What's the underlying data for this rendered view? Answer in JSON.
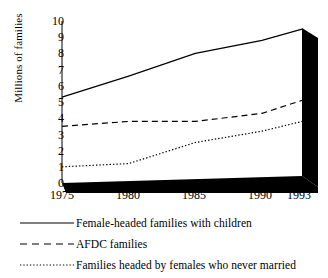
{
  "chart_data": {
    "type": "line",
    "title": "",
    "xlabel": "",
    "ylabel": "Millions of families",
    "x": [
      1975,
      1980,
      1985,
      1990,
      1993
    ],
    "xlim": [
      1975,
      1993
    ],
    "ylim": [
      0,
      10
    ],
    "ytick_labels": [
      "10",
      "9",
      "8",
      "7",
      "6",
      "5",
      "4",
      "3",
      "2",
      "1",
      "0"
    ],
    "ytick_values": [
      10,
      9,
      8,
      7,
      6,
      5,
      4,
      3,
      2,
      1,
      0
    ],
    "xtick_labels": [
      "1975",
      "1980",
      "1985",
      "1990",
      "1993"
    ],
    "grid": false,
    "legend_position": "below",
    "series": [
      {
        "name": "Female-headed families with children",
        "style": "solid",
        "values": [
          5.3,
          6.6,
          8.0,
          8.8,
          9.5
        ]
      },
      {
        "name": "AFDC families",
        "style": "dashed",
        "values": [
          3.5,
          3.8,
          3.8,
          4.3,
          5.1
        ]
      },
      {
        "name": "Families headed by females who never married",
        "style": "dotted",
        "values": [
          1.0,
          1.2,
          2.5,
          3.2,
          3.8
        ]
      }
    ]
  },
  "axis": {
    "y_title": "Millions of families",
    "y_ticks": [
      "10",
      "9",
      "8",
      "7",
      "6",
      "5",
      "4",
      "3",
      "2",
      "1",
      "0"
    ],
    "x_ticks": [
      "1975",
      "1980",
      "1985",
      "1990",
      "1993"
    ]
  },
  "legend": {
    "items": [
      {
        "label": "Female-headed families with children",
        "style": "solid"
      },
      {
        "label": "AFDC families",
        "style": "dashed"
      },
      {
        "label": "Families headed by females who never married",
        "style": "dotted"
      }
    ]
  },
  "colors": {
    "line": "#000000",
    "base": "#000000",
    "background": "#ffffff"
  }
}
